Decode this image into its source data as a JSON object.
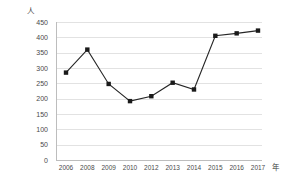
{
  "chart_data": {
    "type": "line",
    "title": "",
    "subtitle": "",
    "xlabel": "年",
    "ylabel": "人",
    "categories": [
      "2006",
      "2008",
      "2009",
      "2010",
      "2012",
      "2013",
      "2014",
      "2015",
      "2016",
      "2017"
    ],
    "values": [
      285,
      360,
      248,
      192,
      208,
      252,
      230,
      405,
      413,
      422
    ],
    "series": [
      {
        "name": "",
        "values": [
          285,
          360,
          248,
          192,
          208,
          252,
          230,
          405,
          413,
          422
        ]
      }
    ],
    "ylim": [
      0,
      450
    ],
    "ytick_step": 50,
    "yticks": [
      0,
      50,
      100,
      150,
      200,
      250,
      300,
      350,
      400,
      450
    ],
    "ytick_labels": [
      "0",
      "50",
      "100",
      "150",
      "200",
      "250",
      "300",
      "350",
      "400",
      "450"
    ],
    "grid": true,
    "grid_axis": "y",
    "legend": false,
    "legend_position": "none",
    "marker": "square",
    "marker_color": "#1a1a1a",
    "line_color": "#262626",
    "grid_color": "#e2e2e2",
    "axis_color": "#bdbdbd",
    "background": "#ffffff"
  }
}
